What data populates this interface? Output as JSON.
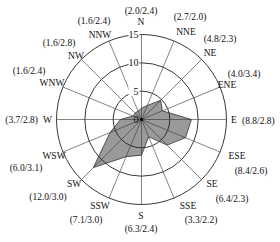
{
  "chart_data": {
    "type": "radar",
    "subtype": "wind-rose",
    "title": "",
    "value_format": "(frequency %/mean speed m/s)",
    "center": [
      141.5,
      119.5
    ],
    "radius_px": 85,
    "rmax": 15,
    "rings": [
      5,
      10,
      15
    ],
    "ring_labels": [
      "5",
      "10",
      "15"
    ],
    "origin_label": "0",
    "fill_color": "#9a9a9a",
    "line_color": "#333333",
    "directions": [
      "N",
      "NNE",
      "NE",
      "ENE",
      "E",
      "ESE",
      "SE",
      "SSE",
      "S",
      "SSW",
      "SW",
      "WSW",
      "W",
      "WNW",
      "NW",
      "NNW"
    ],
    "series": [
      {
        "name": "Frequency",
        "values": [
          2.0,
          2.7,
          4.8,
          4.0,
          8.8,
          8.4,
          6.4,
          3.3,
          6.3,
          7.1,
          12.0,
          6.0,
          3.7,
          1.6,
          1.6,
          1.6
        ]
      },
      {
        "name": "Mean speed",
        "values": [
          2.4,
          2.0,
          2.3,
          3.4,
          2.8,
          2.6,
          2.3,
          2.2,
          2.4,
          3.0,
          3.0,
          3.1,
          2.8,
          2.4,
          2.8,
          2.4
        ]
      }
    ],
    "annotations": [
      "(2.0/2.4)",
      "(2.7/2.0)",
      "(4.8/2.3)",
      "(4.0/3.4)",
      "(8.8/2.8)",
      "(8.4/2.6)",
      "(6.4/2.3)",
      "(3.3/2.2)",
      "(6.3/2.4)",
      "(7.1/3.0)",
      "(12.0/3.0)",
      "(6.0/3.1)",
      "(3.7/2.8)",
      "(1.6/2.4)",
      "(1.6/2.8)",
      "(1.6/2.4)"
    ],
    "label_layout": [
      {
        "dir": [
          141,
          25,
          "middle"
        ],
        "ann": [
          141,
          14,
          "middle"
        ]
      },
      {
        "dir": [
          186,
          35,
          "middle"
        ],
        "ann": [
          190,
          20,
          "middle"
        ]
      },
      {
        "dir": [
          210,
          56,
          "middle"
        ],
        "ann": [
          220,
          42,
          "middle"
        ]
      },
      {
        "dir": [
          227,
          88,
          "middle"
        ],
        "ann": [
          244,
          77,
          "middle"
        ]
      },
      {
        "dir": [
          231,
          123,
          "start"
        ],
        "ann": [
          242,
          124,
          "start"
        ]
      },
      {
        "dir": [
          237,
          159,
          "middle"
        ],
        "ann": [
          251,
          174,
          "middle"
        ]
      },
      {
        "dir": [
          212,
          187,
          "middle"
        ],
        "ann": [
          232,
          202,
          "middle"
        ]
      },
      {
        "dir": [
          188,
          209,
          "middle"
        ],
        "ann": [
          201,
          223,
          "middle"
        ]
      },
      {
        "dir": [
          141,
          219,
          "middle"
        ],
        "ann": [
          141,
          232,
          "middle"
        ]
      },
      {
        "dir": [
          100,
          209,
          "middle"
        ],
        "ann": [
          86,
          223,
          "middle"
        ]
      },
      {
        "dir": [
          74,
          187,
          "middle"
        ],
        "ann": [
          48,
          200,
          "middle"
        ]
      },
      {
        "dir": [
          54,
          159,
          "middle"
        ],
        "ann": [
          26,
          171,
          "middle"
        ]
      },
      {
        "dir": [
          52,
          123,
          "end"
        ],
        "ann": [
          38,
          123,
          "end"
        ]
      },
      {
        "dir": [
          52,
          86,
          "middle"
        ],
        "ann": [
          29,
          74,
          "middle"
        ]
      },
      {
        "dir": [
          76,
          59,
          "middle"
        ],
        "ann": [
          59,
          46,
          "middle"
        ]
      },
      {
        "dir": [
          100,
          38,
          "middle"
        ],
        "ann": [
          94,
          24,
          "middle"
        ]
      }
    ]
  }
}
